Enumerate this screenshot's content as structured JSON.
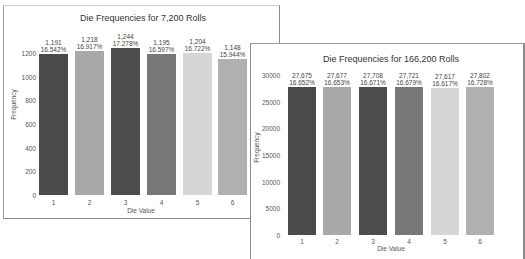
{
  "chart_data": [
    {
      "type": "bar",
      "title": "Die Frequencies for 7,200 Rolls",
      "xlabel": "Die Value",
      "ylabel": "Frequency",
      "categories": [
        "1",
        "2",
        "3",
        "4",
        "5",
        "6"
      ],
      "values": [
        1191,
        1218,
        1244,
        1195,
        1204,
        1148
      ],
      "value_labels": [
        "1,191",
        "1,218",
        "1,244",
        "1,195",
        "1,204",
        "1,148"
      ],
      "percent_labels": [
        "16.542%",
        "16.917%",
        "17.278%",
        "16.597%",
        "16.722%",
        "15.944%"
      ],
      "yticks": [
        "0",
        "200",
        "400",
        "600",
        "800",
        "1000",
        "1200"
      ],
      "ylim": [
        0,
        1250
      ],
      "colors": [
        "#4a4a4a",
        "#a9a9a9",
        "#4d4d4d",
        "#777777",
        "#d6d6d6",
        "#b0b0b0"
      ],
      "grid": false
    },
    {
      "type": "bar",
      "title": "Die Frequencies for 166,200 Rolls",
      "xlabel": "Die Value",
      "ylabel": "Frequency",
      "categories": [
        "1",
        "2",
        "3",
        "4",
        "5",
        "6"
      ],
      "values": [
        27675,
        27677,
        27708,
        27721,
        27617,
        27802
      ],
      "value_labels": [
        "27,675",
        "27,677",
        "27,708",
        "27,721",
        "27,617",
        "27,802"
      ],
      "percent_labels": [
        "16.652%",
        "16.653%",
        "16.671%",
        "16.679%",
        "16.617%",
        "16.728%"
      ],
      "yticks": [
        "0",
        "5000",
        "10000",
        "15000",
        "20000",
        "25000",
        "30000"
      ],
      "ylim": [
        0,
        30000
      ],
      "colors": [
        "#4a4a4a",
        "#a9a9a9",
        "#4d4d4d",
        "#777777",
        "#d6d6d6",
        "#b0b0b0"
      ],
      "grid": false
    }
  ]
}
